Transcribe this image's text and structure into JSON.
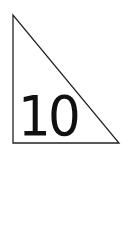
{
  "diagram": {
    "shape": "right-triangle",
    "stroke_color": "#222222",
    "fill_color": "#ffffff",
    "vertices": {
      "top": [
        13,
        15
      ],
      "bottom_left": [
        13,
        143
      ],
      "bottom_right": [
        119,
        143
      ]
    },
    "label": "10"
  }
}
